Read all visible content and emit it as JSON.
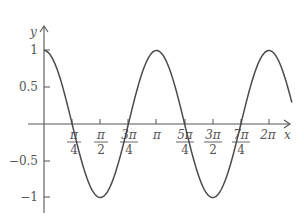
{
  "chart_data": {
    "type": "line",
    "title": "",
    "function": "y = cos(2x)",
    "xlabel": "x",
    "ylabel": "y",
    "xlim": [
      0,
      6.92
    ],
    "ylim": [
      -1,
      1
    ],
    "grid": false,
    "legend": null,
    "x_ticks": [
      {
        "value": 0.7854,
        "num": "π",
        "den": "4"
      },
      {
        "value": 1.5708,
        "num": "π",
        "den": "2"
      },
      {
        "value": 2.3562,
        "num": "3π",
        "den": "4"
      },
      {
        "value": 3.1416,
        "label": "π"
      },
      {
        "value": 3.927,
        "num": "5π",
        "den": "4"
      },
      {
        "value": 4.7124,
        "num": "3π",
        "den": "2"
      },
      {
        "value": 5.4978,
        "num": "7π",
        "den": "4"
      },
      {
        "value": 6.2832,
        "label": "2π"
      }
    ],
    "y_ticks": [
      {
        "value": 1,
        "label": "1"
      },
      {
        "value": 0.5,
        "label": "0.5"
      },
      {
        "value": -0.5,
        "label": "−0.5"
      },
      {
        "value": -1,
        "label": "−1"
      }
    ],
    "series": [
      {
        "name": "cos(2x)",
        "x": [
          0,
          0.3927,
          0.7854,
          1.1781,
          1.5708,
          1.9635,
          2.3562,
          2.7489,
          3.1416,
          3.5343,
          3.927,
          4.3197,
          4.7124,
          5.1051,
          5.4978,
          5.8905,
          6.2832,
          6.92
        ],
        "y": [
          1,
          0.707,
          0,
          -0.707,
          -1,
          -0.707,
          0,
          0.707,
          1,
          0.707,
          0,
          -0.707,
          -1,
          -0.707,
          0,
          0.707,
          1,
          0.28
        ]
      }
    ]
  },
  "labels": {
    "x_axis": "x",
    "y_axis": "y",
    "pi_over_4": {
      "num": "π",
      "den": "4"
    },
    "pi_over_2": {
      "num": "π",
      "den": "2"
    },
    "three_pi_over_4": {
      "num": "3π",
      "den": "4"
    },
    "pi": "π",
    "five_pi_over_4": {
      "num": "5π",
      "den": "4"
    },
    "three_pi_over_2": {
      "num": "3π",
      "den": "2"
    },
    "seven_pi_over_4": {
      "num": "7π",
      "den": "4"
    },
    "two_pi": "2π",
    "y_1": "1",
    "y_05": "0.5",
    "y_m05": "−0.5",
    "y_m1": "−1"
  },
  "colors": {
    "curve": "#4a4a4a",
    "axis": "#555555",
    "background": "#ffffff"
  }
}
